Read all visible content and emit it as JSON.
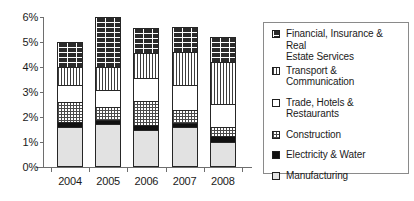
{
  "chart_data": {
    "type": "bar",
    "subtype": "stacked-vertical",
    "title": "",
    "xlabel": "",
    "ylabel": "",
    "categories": [
      "2004",
      "2005",
      "2006",
      "2007",
      "2008"
    ],
    "ylim": [
      0,
      6
    ],
    "ytick_labels": [
      "0%",
      "1%",
      "2%",
      "3%",
      "4%",
      "5%",
      "6%"
    ],
    "ytick_values": [
      0,
      1,
      2,
      3,
      4,
      5,
      6
    ],
    "yunit": "%",
    "grid": false,
    "legend_position": "right",
    "stack_order_bottom_to_top": [
      "Manufacturing",
      "Electricity & Water",
      "Construction",
      "Trade, Hotels & Restaurants",
      "Transport & Communication",
      "Financial, Insurance & Real Estate Services"
    ],
    "series": [
      {
        "name": "Manufacturing",
        "pattern": "light-gray-solid",
        "values": [
          1.6,
          1.72,
          1.48,
          1.6,
          1.02
        ]
      },
      {
        "name": "Electricity & Water",
        "pattern": "black-solid",
        "values": [
          0.2,
          0.18,
          0.22,
          0.18,
          0.22
        ]
      },
      {
        "name": "Construction",
        "pattern": "checker-dot",
        "values": [
          0.82,
          0.52,
          0.96,
          0.52,
          0.38
        ]
      },
      {
        "name": "Trade, Hotels & Restaurants",
        "pattern": "white-plain",
        "values": [
          0.68,
          0.68,
          0.92,
          1.0,
          0.9
        ]
      },
      {
        "name": "Transport & Communication",
        "pattern": "vertical-stripes",
        "values": [
          0.7,
          0.9,
          1.0,
          1.3,
          1.68
        ]
      },
      {
        "name": "Financial, Insurance & Real Estate Services",
        "pattern": "brick",
        "values": [
          1.0,
          2.0,
          1.0,
          1.0,
          1.0
        ]
      }
    ],
    "totals": [
      5.0,
      6.0,
      5.58,
      5.6,
      5.2
    ]
  },
  "legend": {
    "items": [
      {
        "label": "Financial, Insurance & Real\nEstate Services",
        "swatch": "brick-swatch"
      },
      {
        "label": "Transport & Communication",
        "swatch": "vertical-stripes-swatch"
      },
      {
        "label": "Trade, Hotels & Restaurants",
        "swatch": "white-swatch"
      },
      {
        "label": "Construction",
        "swatch": "checker-dot-swatch"
      },
      {
        "label": "Electricity & Water",
        "swatch": "black-swatch"
      },
      {
        "label": "Manufacturing",
        "swatch": "light-gray-swatch"
      }
    ]
  },
  "colors": {
    "axis": "#6e6e6e",
    "text": "#1a1a1a",
    "bar_outline": "#262626",
    "legend_border": "#8a8a8a",
    "background": "#ffffff"
  }
}
